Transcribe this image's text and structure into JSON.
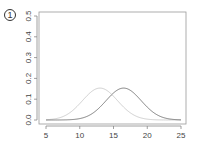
{
  "badge": {
    "label": "1"
  },
  "chart_data": {
    "type": "line",
    "title": "",
    "xlabel": "",
    "ylabel": "",
    "xlim": [
      5,
      25
    ],
    "ylim": [
      0,
      0.5
    ],
    "x_ticks": [
      "5",
      "10",
      "15",
      "20",
      "25"
    ],
    "y_ticks": [
      "0.0",
      "0.1",
      "0.2",
      "0.3",
      "0.4",
      "0.5"
    ],
    "grid": false,
    "legend": null,
    "series": [
      {
        "name": "light curve",
        "distribution": "normal",
        "mean": 13.0,
        "sd": 2.6,
        "peak": 0.153,
        "color": "#c8c8c8"
      },
      {
        "name": "dark curve",
        "distribution": "normal",
        "mean": 16.5,
        "sd": 2.6,
        "peak": 0.153,
        "color": "#707070"
      }
    ]
  },
  "colors": {
    "axis": "#888888",
    "text": "#444444"
  }
}
